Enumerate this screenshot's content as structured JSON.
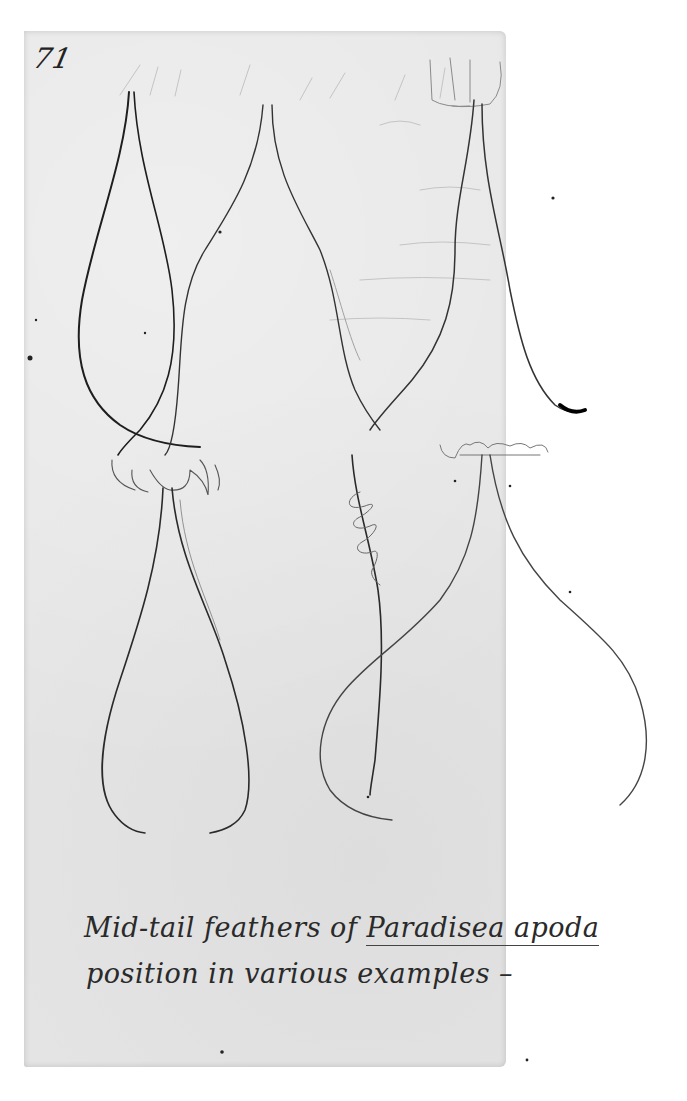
{
  "document": {
    "type": "handwritten notebook page",
    "page_number": "71",
    "caption": {
      "line1_prefix": "Mid-tail feathers of ",
      "line1_species": "Paradisea apoda",
      "line2": "position in various examples –"
    },
    "sketches": [
      {
        "name": "teardrop-feather-pair-top-left",
        "description": "Two mid-tail feather shafts forming a teardrop loop, crossing at bottom"
      },
      {
        "name": "flask-feather-pair-top-middle",
        "description": "Two shafts diverging from a point then curving outward"
      },
      {
        "name": "feather-pair-top-right",
        "description": "Two shafts with a hooked dark tip at lower right"
      },
      {
        "name": "heart-feather-pair-bottom-left",
        "description": "Two shafts from a tuft forming an inverted heart/loop shape"
      },
      {
        "name": "spiral-feather-bottom-middle",
        "description": "Single shaft with a coiled spiral near its top"
      },
      {
        "name": "bell-feather-pair-bottom-right",
        "description": "Two shafts from a tuft spreading into a wide bell shape"
      }
    ],
    "colors": {
      "paper": "#e6e6e6",
      "ink": "#2a2a2a",
      "pencil": "#555555",
      "background": "#ffffff"
    }
  }
}
